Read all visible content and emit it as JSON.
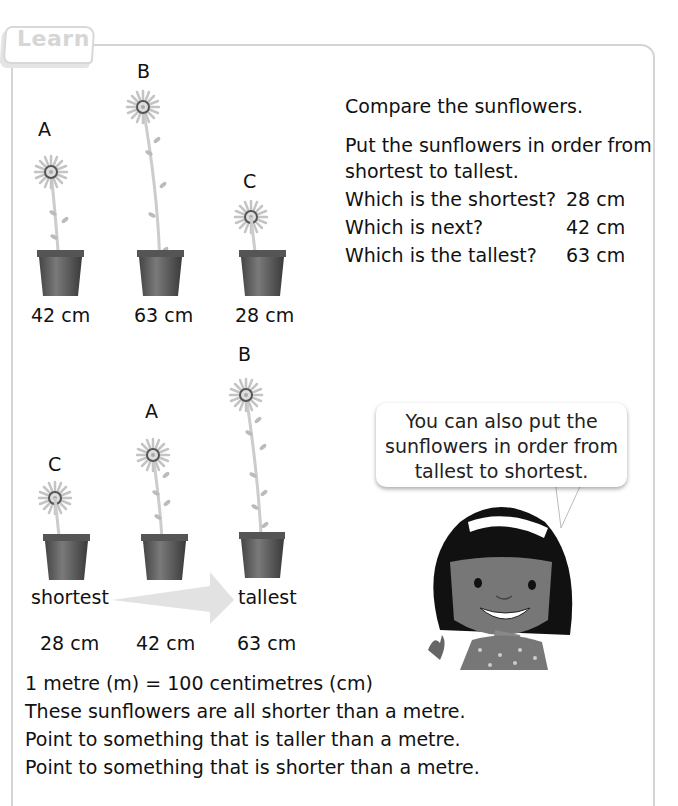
{
  "section": {
    "tab_label": "Learn"
  },
  "top_group": {
    "plants": [
      {
        "letter": "A",
        "height_cm": 42,
        "label": "42 cm"
      },
      {
        "letter": "B",
        "height_cm": 63,
        "label": "63 cm"
      },
      {
        "letter": "C",
        "height_cm": 28,
        "label": "28 cm"
      }
    ]
  },
  "instructions": {
    "compare": "Compare the sunflowers.",
    "order_line1": "Put the sunflowers in order from",
    "order_line2": "shortest to tallest.",
    "questions": [
      {
        "q": "Which is the shortest?",
        "a": "28 cm"
      },
      {
        "q": "Which is next?",
        "a": "42 cm"
      },
      {
        "q": "Which is the tallest?",
        "a": "63 cm"
      }
    ]
  },
  "ordered_group": {
    "plants": [
      {
        "letter": "C",
        "label": "28 cm"
      },
      {
        "letter": "A",
        "label": "42 cm"
      },
      {
        "letter": "B",
        "label": "63 cm"
      }
    ],
    "start_label": "shortest",
    "end_label": "tallest"
  },
  "speech_bubble": {
    "line1": "You can also put the",
    "line2": "sunflowers in order from",
    "line3": "tallest to shortest."
  },
  "footer": {
    "lines": [
      "1 metre (m) = 100 centimetres (cm)",
      "These sunflowers are all shorter than a metre.",
      "Point to something that is taller than a metre.",
      "Point to something that is shorter than a metre."
    ]
  }
}
